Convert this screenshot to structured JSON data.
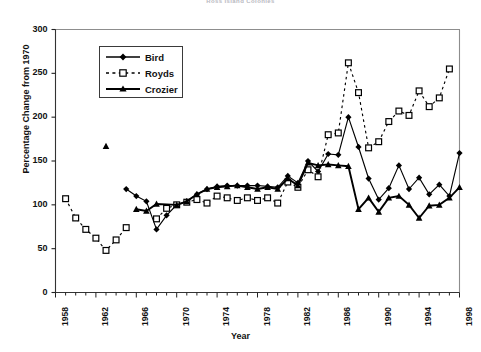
{
  "chart_data": {
    "type": "line",
    "title": "Ross Island Colonies",
    "xlabel": "Year",
    "ylabel": "Percentage Change from 1970",
    "xlim": [
      1958,
      1998
    ],
    "ylim": [
      0,
      300
    ],
    "ytick_labels": [
      "0",
      "50",
      "100",
      "150",
      "200",
      "250",
      "300"
    ],
    "yticks": [
      0,
      50,
      100,
      150,
      200,
      250,
      300
    ],
    "xtick_labels": [
      "1958",
      "1962",
      "1966",
      "1970",
      "1974",
      "1978",
      "1982",
      "1986",
      "1990",
      "1994",
      "1998"
    ],
    "xticks": [
      1958,
      1962,
      1966,
      1970,
      1974,
      1978,
      1982,
      1986,
      1990,
      1994,
      1998
    ],
    "minor_xtick_interval": 1,
    "grid": false,
    "legend_position": "upper-left-inside",
    "series": [
      {
        "name": "Bird",
        "marker": "filled-diamond",
        "line": "solid",
        "color": "#000000",
        "points": [
          {
            "x": 1965,
            "y": 118
          },
          {
            "x": 1966,
            "y": 110
          },
          {
            "x": 1967,
            "y": 104
          },
          {
            "x": 1968,
            "y": 72
          },
          {
            "x": 1969,
            "y": 88
          },
          {
            "x": 1970,
            "y": 100
          },
          {
            "x": 1971,
            "y": 104
          },
          {
            "x": 1972,
            "y": 112
          },
          {
            "x": 1973,
            "y": 118
          },
          {
            "x": 1974,
            "y": 121
          },
          {
            "x": 1975,
            "y": 122
          },
          {
            "x": 1976,
            "y": 122
          },
          {
            "x": 1977,
            "y": 122
          },
          {
            "x": 1978,
            "y": 122
          },
          {
            "x": 1979,
            "y": 121
          },
          {
            "x": 1980,
            "y": 120
          },
          {
            "x": 1981,
            "y": 133
          },
          {
            "x": 1982,
            "y": 125
          },
          {
            "x": 1983,
            "y": 150
          },
          {
            "x": 1984,
            "y": 138
          },
          {
            "x": 1985,
            "y": 158
          },
          {
            "x": 1986,
            "y": 157
          },
          {
            "x": 1987,
            "y": 200
          },
          {
            "x": 1988,
            "y": 166
          },
          {
            "x": 1989,
            "y": 130
          },
          {
            "x": 1990,
            "y": 106
          },
          {
            "x": 1991,
            "y": 119
          },
          {
            "x": 1992,
            "y": 145
          },
          {
            "x": 1993,
            "y": 118
          },
          {
            "x": 1994,
            "y": 131
          },
          {
            "x": 1995,
            "y": 112
          },
          {
            "x": 1996,
            "y": 123
          },
          {
            "x": 1997,
            "y": 110
          },
          {
            "x": 1998,
            "y": 159
          }
        ]
      },
      {
        "name": "Royds",
        "marker": "open-square",
        "line": "dashed",
        "color": "#000000",
        "points": [
          {
            "x": 1959,
            "y": 107
          },
          {
            "x": 1960,
            "y": 85
          },
          {
            "x": 1961,
            "y": 72
          },
          {
            "x": 1962,
            "y": 62
          },
          {
            "x": 1963,
            "y": 48
          },
          {
            "x": 1964,
            "y": 60
          },
          {
            "x": 1965,
            "y": 74
          },
          {
            "x": 1968,
            "y": 84
          },
          {
            "x": 1969,
            "y": 96
          },
          {
            "x": 1970,
            "y": 100
          },
          {
            "x": 1971,
            "y": 103
          },
          {
            "x": 1972,
            "y": 106
          },
          {
            "x": 1973,
            "y": 102
          },
          {
            "x": 1974,
            "y": 110
          },
          {
            "x": 1975,
            "y": 108
          },
          {
            "x": 1976,
            "y": 105
          },
          {
            "x": 1977,
            "y": 108
          },
          {
            "x": 1978,
            "y": 105
          },
          {
            "x": 1979,
            "y": 108
          },
          {
            "x": 1980,
            "y": 102
          },
          {
            "x": 1981,
            "y": 126
          },
          {
            "x": 1982,
            "y": 120
          },
          {
            "x": 1983,
            "y": 140
          },
          {
            "x": 1984,
            "y": 132
          },
          {
            "x": 1985,
            "y": 180
          },
          {
            "x": 1986,
            "y": 182
          },
          {
            "x": 1987,
            "y": 262
          },
          {
            "x": 1988,
            "y": 228
          },
          {
            "x": 1989,
            "y": 165
          },
          {
            "x": 1990,
            "y": 172
          },
          {
            "x": 1991,
            "y": 195
          },
          {
            "x": 1992,
            "y": 207
          },
          {
            "x": 1993,
            "y": 202
          },
          {
            "x": 1994,
            "y": 230
          },
          {
            "x": 1995,
            "y": 212
          },
          {
            "x": 1996,
            "y": 222
          },
          {
            "x": 1997,
            "y": 255
          }
        ]
      },
      {
        "name": "Crozier",
        "marker": "filled-triangle",
        "line": "solid",
        "color": "#000000",
        "points": [
          {
            "x": 1963,
            "y": 167
          },
          {
            "x": 1966,
            "y": 95
          },
          {
            "x": 1967,
            "y": 93
          },
          {
            "x": 1968,
            "y": 101
          },
          {
            "x": 1970,
            "y": 100
          },
          {
            "x": 1971,
            "y": 104
          },
          {
            "x": 1972,
            "y": 112
          },
          {
            "x": 1973,
            "y": 118
          },
          {
            "x": 1974,
            "y": 120
          },
          {
            "x": 1975,
            "y": 121
          },
          {
            "x": 1976,
            "y": 122
          },
          {
            "x": 1977,
            "y": 120
          },
          {
            "x": 1978,
            "y": 118
          },
          {
            "x": 1979,
            "y": 120
          },
          {
            "x": 1980,
            "y": 118
          },
          {
            "x": 1981,
            "y": 130
          },
          {
            "x": 1982,
            "y": 122
          },
          {
            "x": 1983,
            "y": 148
          },
          {
            "x": 1984,
            "y": 145
          },
          {
            "x": 1985,
            "y": 146
          },
          {
            "x": 1986,
            "y": 145
          },
          {
            "x": 1987,
            "y": 144
          },
          {
            "x": 1988,
            "y": 95
          },
          {
            "x": 1989,
            "y": 108
          },
          {
            "x": 1990,
            "y": 92
          },
          {
            "x": 1991,
            "y": 108
          },
          {
            "x": 1992,
            "y": 110
          },
          {
            "x": 1993,
            "y": 100
          },
          {
            "x": 1994,
            "y": 85
          },
          {
            "x": 1995,
            "y": 99
          },
          {
            "x": 1996,
            "y": 100
          },
          {
            "x": 1997,
            "y": 108
          },
          {
            "x": 1998,
            "y": 120
          }
        ]
      }
    ]
  },
  "legend": {
    "entries": [
      {
        "label": "Bird"
      },
      {
        "label": "Royds"
      },
      {
        "label": "Crozier"
      }
    ]
  }
}
